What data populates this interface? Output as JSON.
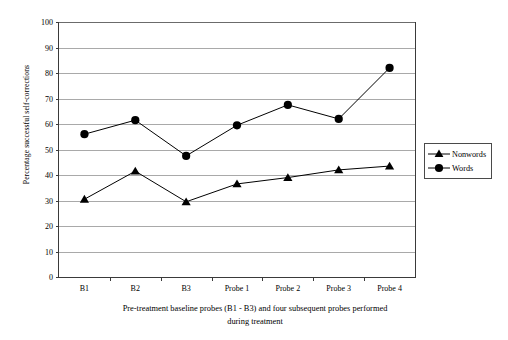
{
  "chart_data": {
    "type": "line",
    "title": "",
    "xlabel": "Pre-treatment baseline probes (B1 - B3) and four subsequent probes performed during treatment",
    "xlabel_line1": "Pre-treatment baseline probes (B1 - B3) and four subsequent probes performed",
    "xlabel_line2": "during treatment",
    "ylabel": "Percentage successful self-corrections",
    "categories": [
      "B1",
      "B2",
      "B3",
      "Probe 1",
      "Probe 2",
      "Probe 3",
      "Probe 4"
    ],
    "series": [
      {
        "name": "Nonwords",
        "marker": "triangle",
        "color": "#000000",
        "values": [
          30.5,
          41.5,
          29.5,
          36.5,
          39.0,
          42.0,
          43.5
        ]
      },
      {
        "name": "Words",
        "marker": "circle",
        "color": "#000000",
        "values": [
          56.0,
          61.5,
          47.5,
          59.5,
          67.5,
          62.0,
          82.0
        ]
      }
    ],
    "ylim": [
      0,
      100
    ],
    "ytick_values": [
      0,
      10,
      20,
      30,
      40,
      50,
      60,
      70,
      80,
      90,
      100
    ],
    "ytick_labels": [
      "0",
      "10",
      "20",
      "30",
      "40",
      "50",
      "60",
      "70",
      "80",
      "90",
      "100"
    ],
    "grid": true,
    "grid_axis": "y",
    "legend_position": "right-outside"
  },
  "legend": {
    "entries": [
      {
        "label": "Nonwords",
        "marker": "triangle-marker-icon"
      },
      {
        "label": "Words",
        "marker": "circle-marker-icon"
      }
    ]
  },
  "colors": {
    "axis": "#3a3a3a",
    "grid": "#a9a9a9",
    "series": "#000000",
    "background": "#ffffff"
  }
}
